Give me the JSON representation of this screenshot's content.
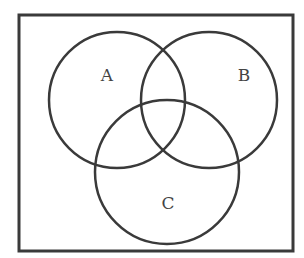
{
  "diagram": {
    "type": "venn",
    "universe": {
      "x": 19,
      "y": 15,
      "width": 274,
      "height": 236
    },
    "stroke_color": "#3a3a3a",
    "background": "#ffffff",
    "sets": [
      {
        "label": "A",
        "cx": 117,
        "cy": 100,
        "r": 68,
        "label_x": 107,
        "label_y": 81
      },
      {
        "label": "B",
        "cx": 209,
        "cy": 100,
        "r": 68,
        "label_x": 244,
        "label_y": 81
      },
      {
        "label": "C",
        "cx": 167,
        "cy": 172,
        "r": 72,
        "label_x": 168,
        "label_y": 209
      }
    ]
  }
}
